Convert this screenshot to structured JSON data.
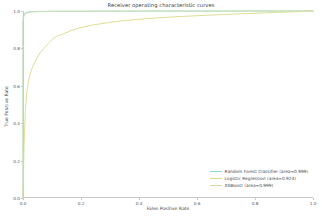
{
  "chart_data": {
    "type": "line",
    "title": "Receiver operating characteristic curves",
    "xlabel": "False Positive Rate",
    "ylabel": "True Positive Rate",
    "xlim": [
      0.0,
      1.0
    ],
    "ylim": [
      0.0,
      1.0
    ],
    "grid": false,
    "legend_position": "lower right",
    "xticks": [
      "0.0",
      "0.2",
      "0.4",
      "0.6",
      "0.8",
      "1.0"
    ],
    "xtick_values": [
      0.0,
      0.2,
      0.4,
      0.6,
      0.8,
      1.0
    ],
    "yticks": [
      "0.0",
      "0.2",
      "0.4",
      "0.6",
      "0.8",
      "1.0"
    ],
    "ytick_values": [
      0.0,
      0.2,
      0.4,
      0.6,
      0.8,
      1.0
    ],
    "series": [
      {
        "name": "Random Forest Classifier (area=0.999)",
        "color": "#8fd4d4",
        "auc": 0.999,
        "x": [
          0.0,
          0.0,
          0.002,
          0.004,
          0.008,
          0.014,
          0.022,
          0.035,
          0.05,
          0.08,
          0.12,
          0.18,
          0.26,
          0.36,
          0.48,
          0.62,
          0.78,
          0.9,
          1.0
        ],
        "y": [
          0.0,
          0.955,
          0.975,
          0.984,
          0.99,
          0.993,
          0.995,
          0.9965,
          0.9975,
          0.998,
          0.9985,
          0.999,
          0.9992,
          0.9994,
          0.9996,
          0.9997,
          0.9998,
          0.9999,
          1.0
        ]
      },
      {
        "name": "Logistic Regression (area=0.924)",
        "color": "#ddd98a",
        "auc": 0.924,
        "x": [
          0.0,
          0.004,
          0.008,
          0.012,
          0.018,
          0.026,
          0.034,
          0.045,
          0.058,
          0.072,
          0.09,
          0.105,
          0.12,
          0.14,
          0.165,
          0.2,
          0.24,
          0.29,
          0.34,
          0.4,
          0.47,
          0.55,
          0.63,
          0.72,
          0.8,
          0.88,
          0.94,
          1.0
        ],
        "y": [
          0.0,
          0.3,
          0.46,
          0.55,
          0.62,
          0.67,
          0.705,
          0.74,
          0.775,
          0.8,
          0.83,
          0.855,
          0.868,
          0.878,
          0.895,
          0.912,
          0.925,
          0.937,
          0.947,
          0.956,
          0.964,
          0.971,
          0.977,
          0.983,
          0.988,
          0.993,
          0.996,
          1.0
        ]
      },
      {
        "name": "XGBoost (area=0.999)",
        "color": "#cfe0a8",
        "auc": 0.999,
        "x": [
          0.0,
          0.0,
          0.003,
          0.006,
          0.011,
          0.018,
          0.028,
          0.042,
          0.06,
          0.09,
          0.13,
          0.19,
          0.27,
          0.37,
          0.49,
          0.63,
          0.79,
          0.91,
          1.0
        ],
        "y": [
          0.0,
          0.945,
          0.97,
          0.981,
          0.988,
          0.992,
          0.9945,
          0.996,
          0.997,
          0.9978,
          0.9983,
          0.9988,
          0.9991,
          0.9993,
          0.9995,
          0.9997,
          0.9998,
          0.9999,
          1.0
        ]
      }
    ]
  }
}
